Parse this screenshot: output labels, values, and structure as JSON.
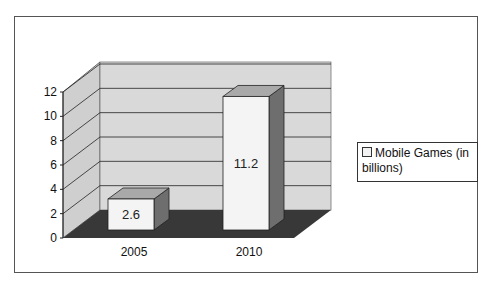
{
  "chart_data": {
    "type": "bar",
    "style": "3d-column",
    "title": "",
    "xlabel": "",
    "ylabel": "",
    "categories": [
      "2005",
      "2010"
    ],
    "series": [
      {
        "name": "Mobile Games (in billions)",
        "values": [
          2.6,
          11.2
        ]
      }
    ],
    "data_labels": [
      "2.6",
      "11.2"
    ],
    "ylim": [
      0,
      12
    ],
    "yticks": [
      "0",
      "2",
      "4",
      "6",
      "8",
      "10",
      "12"
    ],
    "grid": true,
    "legend_position": "right",
    "colors": {
      "bar_front": "#f4f4f4",
      "bar_side": "#6e6e6e",
      "bar_top": "#a9a9a9",
      "wall": "#d6d6d6",
      "floor": "#3a3a3a"
    }
  },
  "legend": {
    "label": "Mobile Games (in billions)"
  }
}
